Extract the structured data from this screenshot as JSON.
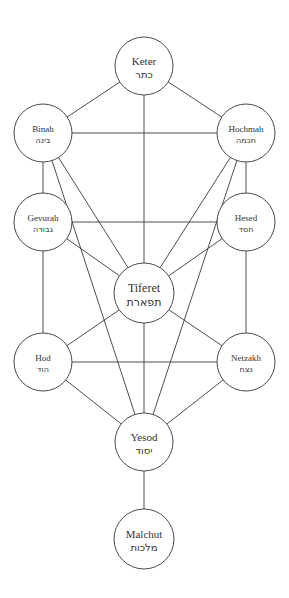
{
  "diagram": {
    "stroke_color": "#3a3a3a",
    "background": "#ffffff",
    "nodes": [
      {
        "id": "keter",
        "label": "Keter",
        "hebrew": "כתר",
        "cx": 144,
        "cy": 66,
        "r": 29,
        "font_size": 11
      },
      {
        "id": "binah",
        "label": "Binah",
        "hebrew": "בינה",
        "cx": 43,
        "cy": 133,
        "r": 29,
        "font_size": 9
      },
      {
        "id": "hochmah",
        "label": "Hochmah",
        "hebrew": "חכמה",
        "cx": 246,
        "cy": 133,
        "r": 29,
        "font_size": 9
      },
      {
        "id": "gevurah",
        "label": "Gevurah",
        "hebrew": "גבורה",
        "cx": 43,
        "cy": 222,
        "r": 29,
        "font_size": 9
      },
      {
        "id": "hesed",
        "label": "Hesed",
        "hebrew": "חסד",
        "cx": 246,
        "cy": 222,
        "r": 29,
        "font_size": 9
      },
      {
        "id": "tiferet",
        "label": "Tiferet",
        "hebrew": "תפארת",
        "cx": 144,
        "cy": 293,
        "r": 30,
        "font_size": 12
      },
      {
        "id": "hod",
        "label": "Hod",
        "hebrew": "הוד",
        "cx": 43,
        "cy": 362,
        "r": 29,
        "font_size": 9
      },
      {
        "id": "netzakh",
        "label": "Netzakh",
        "hebrew": "נצח",
        "cx": 246,
        "cy": 362,
        "r": 29,
        "font_size": 9
      },
      {
        "id": "yesod",
        "label": "Yesod",
        "hebrew": "יסוד",
        "cx": 144,
        "cy": 442,
        "r": 29,
        "font_size": 11
      },
      {
        "id": "malchut",
        "label": "Malchut",
        "hebrew": "מלכות",
        "cx": 144,
        "cy": 539,
        "r": 30,
        "font_size": 11
      }
    ],
    "edges": [
      [
        "keter",
        "binah"
      ],
      [
        "keter",
        "hochmah"
      ],
      [
        "keter",
        "tiferet"
      ],
      [
        "binah",
        "hochmah"
      ],
      [
        "binah",
        "gevurah"
      ],
      [
        "binah",
        "tiferet"
      ],
      [
        "binah",
        "yesod"
      ],
      [
        "hochmah",
        "hesed"
      ],
      [
        "hochmah",
        "tiferet"
      ],
      [
        "hochmah",
        "yesod"
      ],
      [
        "gevurah",
        "hesed"
      ],
      [
        "gevurah",
        "tiferet"
      ],
      [
        "gevurah",
        "hod"
      ],
      [
        "hesed",
        "tiferet"
      ],
      [
        "hesed",
        "netzakh"
      ],
      [
        "tiferet",
        "hod"
      ],
      [
        "tiferet",
        "netzakh"
      ],
      [
        "tiferet",
        "yesod"
      ],
      [
        "hod",
        "netzakh"
      ],
      [
        "hod",
        "yesod"
      ],
      [
        "netzakh",
        "yesod"
      ],
      [
        "yesod",
        "malchut"
      ]
    ]
  }
}
